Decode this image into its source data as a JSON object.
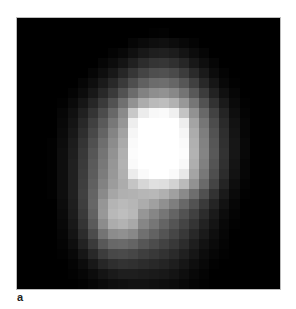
{
  "figure": {
    "panel_label": "a",
    "grid": {
      "cols": 26,
      "rows": 27,
      "pixels": [
        [
          0,
          0,
          0,
          0,
          0,
          0,
          0,
          0,
          0,
          0,
          0,
          0,
          0,
          0,
          0,
          0,
          0,
          0,
          0,
          0,
          0,
          0,
          0,
          0,
          0,
          0
        ],
        [
          0,
          0,
          0,
          0,
          0,
          0,
          0,
          0,
          0,
          0,
          0,
          0,
          0,
          2,
          3,
          0,
          0,
          0,
          0,
          0,
          0,
          0,
          0,
          0,
          0,
          0
        ],
        [
          0,
          0,
          0,
          0,
          0,
          0,
          0,
          0,
          0,
          0,
          0,
          6,
          10,
          14,
          16,
          12,
          8,
          4,
          0,
          0,
          0,
          0,
          0,
          0,
          0,
          0
        ],
        [
          0,
          0,
          0,
          0,
          0,
          0,
          0,
          0,
          0,
          4,
          8,
          16,
          24,
          30,
          32,
          28,
          20,
          12,
          6,
          0,
          0,
          0,
          0,
          0,
          0,
          0
        ],
        [
          0,
          0,
          0,
          0,
          0,
          0,
          0,
          0,
          6,
          12,
          20,
          32,
          44,
          52,
          54,
          48,
          38,
          24,
          14,
          6,
          0,
          0,
          0,
          0,
          0,
          0
        ],
        [
          0,
          0,
          0,
          0,
          0,
          0,
          0,
          6,
          14,
          24,
          38,
          54,
          68,
          78,
          80,
          74,
          60,
          42,
          26,
          12,
          4,
          0,
          0,
          0,
          0,
          0
        ],
        [
          0,
          0,
          0,
          0,
          0,
          0,
          6,
          14,
          26,
          40,
          58,
          78,
          96,
          108,
          110,
          102,
          86,
          64,
          40,
          22,
          8,
          2,
          0,
          0,
          0,
          0
        ],
        [
          0,
          0,
          0,
          0,
          0,
          4,
          12,
          24,
          40,
          58,
          82,
          108,
          130,
          142,
          146,
          136,
          116,
          88,
          60,
          34,
          16,
          6,
          0,
          0,
          0,
          0
        ],
        [
          0,
          0,
          0,
          0,
          2,
          10,
          22,
          38,
          58,
          82,
          112,
          146,
          172,
          186,
          190,
          178,
          152,
          118,
          82,
          50,
          26,
          10,
          2,
          0,
          0,
          0
        ],
        [
          0,
          0,
          0,
          0,
          6,
          16,
          32,
          52,
          76,
          104,
          138,
          200,
          236,
          248,
          250,
          240,
          196,
          146,
          104,
          66,
          36,
          14,
          4,
          0,
          0,
          0
        ],
        [
          0,
          0,
          0,
          0,
          8,
          20,
          40,
          64,
          90,
          120,
          150,
          238,
          255,
          255,
          255,
          255,
          238,
          164,
          118,
          76,
          42,
          18,
          6,
          0,
          0,
          0
        ],
        [
          0,
          0,
          0,
          0,
          10,
          24,
          46,
          72,
          100,
          132,
          162,
          246,
          255,
          255,
          255,
          255,
          246,
          172,
          126,
          82,
          46,
          20,
          6,
          0,
          0,
          0
        ],
        [
          0,
          0,
          0,
          2,
          12,
          28,
          52,
          80,
          110,
          140,
          170,
          250,
          255,
          255,
          255,
          255,
          250,
          176,
          130,
          86,
          48,
          22,
          8,
          0,
          0,
          0
        ],
        [
          0,
          0,
          0,
          2,
          14,
          30,
          56,
          86,
          116,
          146,
          176,
          252,
          255,
          255,
          255,
          255,
          252,
          178,
          132,
          88,
          50,
          22,
          8,
          0,
          0,
          0
        ],
        [
          0,
          0,
          0,
          2,
          14,
          32,
          58,
          90,
          120,
          150,
          178,
          250,
          255,
          255,
          255,
          255,
          248,
          174,
          128,
          84,
          48,
          20,
          6,
          0,
          0,
          0
        ],
        [
          0,
          0,
          0,
          2,
          14,
          32,
          60,
          92,
          124,
          152,
          176,
          236,
          250,
          255,
          255,
          250,
          232,
          164,
          120,
          78,
          44,
          18,
          6,
          0,
          0,
          0
        ],
        [
          0,
          0,
          0,
          2,
          14,
          32,
          62,
          96,
          130,
          156,
          172,
          196,
          214,
          224,
          222,
          210,
          186,
          146,
          106,
          68,
          36,
          14,
          4,
          0,
          0,
          0
        ],
        [
          0,
          0,
          0,
          2,
          14,
          32,
          64,
          100,
          138,
          166,
          176,
          178,
          182,
          184,
          176,
          160,
          138,
          110,
          80,
          50,
          26,
          10,
          2,
          0,
          0,
          0
        ],
        [
          0,
          0,
          0,
          0,
          12,
          30,
          62,
          102,
          150,
          180,
          186,
          182,
          172,
          160,
          144,
          126,
          104,
          82,
          58,
          36,
          18,
          6,
          0,
          0,
          0,
          0
        ],
        [
          0,
          0,
          0,
          0,
          10,
          28,
          58,
          98,
          152,
          184,
          190,
          184,
          150,
          134,
          118,
          100,
          82,
          64,
          44,
          26,
          12,
          4,
          0,
          0,
          0,
          0
        ],
        [
          0,
          0,
          0,
          0,
          8,
          24,
          52,
          90,
          140,
          172,
          178,
          168,
          134,
          118,
          100,
          84,
          68,
          52,
          34,
          20,
          8,
          2,
          0,
          0,
          0,
          0
        ],
        [
          0,
          0,
          0,
          0,
          6,
          20,
          44,
          76,
          116,
          140,
          144,
          136,
          112,
          98,
          84,
          70,
          56,
          40,
          26,
          14,
          6,
          0,
          0,
          0,
          0,
          0
        ],
        [
          0,
          0,
          0,
          0,
          4,
          14,
          34,
          58,
          88,
          104,
          106,
          100,
          86,
          76,
          66,
          56,
          44,
          30,
          18,
          10,
          4,
          0,
          0,
          0,
          0,
          0
        ],
        [
          0,
          0,
          0,
          0,
          2,
          8,
          22,
          40,
          60,
          72,
          74,
          70,
          62,
          56,
          50,
          42,
          32,
          22,
          12,
          6,
          2,
          0,
          0,
          0,
          0,
          0
        ],
        [
          0,
          0,
          0,
          0,
          0,
          4,
          12,
          24,
          38,
          46,
          50,
          48,
          44,
          40,
          36,
          30,
          22,
          14,
          8,
          2,
          0,
          0,
          0,
          0,
          0,
          0
        ],
        [
          0,
          0,
          0,
          0,
          0,
          2,
          6,
          12,
          20,
          26,
          30,
          30,
          28,
          26,
          24,
          20,
          14,
          8,
          4,
          0,
          0,
          0,
          0,
          0,
          0,
          0
        ],
        [
          0,
          0,
          0,
          0,
          0,
          0,
          2,
          6,
          10,
          14,
          16,
          18,
          18,
          16,
          14,
          12,
          8,
          4,
          2,
          0,
          0,
          0,
          0,
          0,
          0,
          0
        ]
      ]
    }
  }
}
